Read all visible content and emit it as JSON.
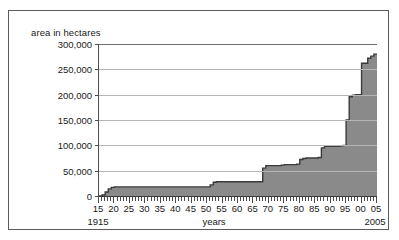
{
  "chart_data": {
    "type": "area",
    "title": "",
    "ylabel": "area in hectares",
    "xlabel": "years",
    "ylim": [
      0,
      300000
    ],
    "xlim": [
      1915,
      2005
    ],
    "grid": true,
    "legend": null,
    "fill_color": "#8a8a8a",
    "line_color": "#3a3a3a",
    "grid_color": "#b5b5b5",
    "y_ticks": [
      "0",
      "50,000",
      "100,000",
      "150,000",
      "200,000",
      "250,000",
      "300,000"
    ],
    "y_tick_values": [
      0,
      50000,
      100000,
      150000,
      200000,
      250000,
      300000
    ],
    "x_ticks": [
      "15",
      "20",
      "25",
      "30",
      "35",
      "40",
      "45",
      "50",
      "55",
      "60",
      "65",
      "70",
      "75",
      "80",
      "85",
      "90",
      "95",
      "00",
      "05"
    ],
    "x_tick_values": [
      1915,
      1920,
      1925,
      1930,
      1935,
      1940,
      1945,
      1950,
      1955,
      1960,
      1965,
      1970,
      1975,
      1980,
      1985,
      1990,
      1995,
      2000,
      2005
    ],
    "x_axis_start_caption": "1915",
    "x_axis_end_caption": "2005",
    "x": [
      1915,
      1916,
      1917,
      1918,
      1919,
      1920,
      1925,
      1930,
      1935,
      1940,
      1945,
      1950,
      1951,
      1952,
      1953,
      1960,
      1965,
      1967,
      1968,
      1969,
      1974,
      1975,
      1979,
      1980,
      1981,
      1982,
      1986,
      1987,
      1988,
      1993,
      1994,
      1995,
      1996,
      1997,
      1998,
      2000,
      2002,
      2003,
      2004,
      2005
    ],
    "y": [
      0,
      2000,
      8000,
      14000,
      17000,
      18000,
      18000,
      18000,
      18000,
      18000,
      18000,
      18000,
      22000,
      27000,
      28000,
      28000,
      28000,
      28000,
      55000,
      60000,
      61000,
      62000,
      63000,
      72000,
      74000,
      75000,
      76000,
      95000,
      98000,
      99000,
      100000,
      150000,
      196000,
      199000,
      200000,
      262000,
      272000,
      276000,
      280000,
      281000
    ]
  }
}
